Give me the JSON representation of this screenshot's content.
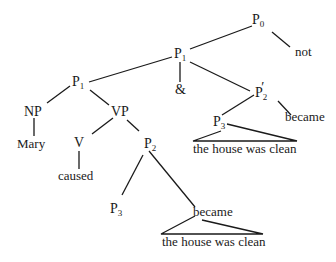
{
  "diagram": {
    "type": "syntax-tree",
    "nodes": {
      "p0": {
        "base": "P",
        "sub": "0"
      },
      "not": {
        "text": "not"
      },
      "p1_top": {
        "base": "P",
        "sub": "1"
      },
      "amp": {
        "text": "&"
      },
      "p2prime": {
        "base": "P",
        "sub": "2",
        "prime": "′"
      },
      "p3_right": {
        "base": "P",
        "sub": "3"
      },
      "became_right": {
        "text": "became"
      },
      "clause_right": {
        "text": "the house was clean"
      },
      "p1_left": {
        "base": "P",
        "sub": "1"
      },
      "np": {
        "text": "NP"
      },
      "mary": {
        "text": "Mary"
      },
      "vp": {
        "text": "VP"
      },
      "v": {
        "text": "V"
      },
      "caused": {
        "text": "caused"
      },
      "p2": {
        "base": "P",
        "sub": "2"
      },
      "p3_left": {
        "base": "P",
        "sub": "3"
      },
      "became_left": {
        "text": "became"
      },
      "clause_left": {
        "text": "the house was clean"
      }
    },
    "edges": [
      [
        "p0",
        "p1_top"
      ],
      [
        "p0",
        "not"
      ],
      [
        "p1_top",
        "p1_left"
      ],
      [
        "p1_top",
        "amp"
      ],
      [
        "p1_top",
        "p2prime"
      ],
      [
        "p2prime",
        "p3_right"
      ],
      [
        "p2prime",
        "became_right"
      ],
      [
        "p3_right",
        "clause_right"
      ],
      [
        "p1_left",
        "np"
      ],
      [
        "p1_left",
        "vp"
      ],
      [
        "np",
        "mary"
      ],
      [
        "vp",
        "v"
      ],
      [
        "vp",
        "p2"
      ],
      [
        "v",
        "caused"
      ],
      [
        "p2",
        "p3_left"
      ],
      [
        "p2",
        "became_left"
      ],
      [
        "became_left",
        "clause_left"
      ]
    ]
  }
}
